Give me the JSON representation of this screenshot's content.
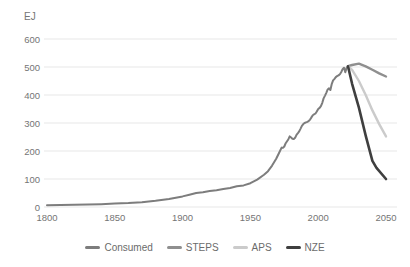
{
  "chart_data": {
    "type": "line",
    "title": "",
    "unit_label": "EJ",
    "xlabel": "",
    "ylabel": "EJ",
    "xlim": [
      1800,
      2050
    ],
    "ylim": [
      0,
      600
    ],
    "x_ticks": [
      1800,
      1850,
      1900,
      1950,
      2000,
      2050
    ],
    "y_ticks": [
      600,
      500,
      400,
      300,
      200,
      100,
      0
    ],
    "grid": "horizontal",
    "legend_position": "bottom",
    "series": [
      {
        "name": "Consumed",
        "color": "#7d7d7d",
        "width": 2,
        "points": [
          [
            1800,
            6
          ],
          [
            1810,
            7
          ],
          [
            1820,
            8
          ],
          [
            1830,
            9
          ],
          [
            1840,
            10
          ],
          [
            1850,
            12
          ],
          [
            1860,
            14
          ],
          [
            1870,
            17
          ],
          [
            1880,
            22
          ],
          [
            1890,
            29
          ],
          [
            1900,
            38
          ],
          [
            1905,
            44
          ],
          [
            1910,
            50
          ],
          [
            1915,
            53
          ],
          [
            1920,
            57
          ],
          [
            1925,
            60
          ],
          [
            1930,
            64
          ],
          [
            1935,
            68
          ],
          [
            1940,
            74
          ],
          [
            1945,
            77
          ],
          [
            1950,
            85
          ],
          [
            1955,
            98
          ],
          [
            1960,
            115
          ],
          [
            1963,
            128
          ],
          [
            1966,
            148
          ],
          [
            1969,
            172
          ],
          [
            1971,
            192
          ],
          [
            1973,
            212
          ],
          [
            1974,
            211
          ],
          [
            1975,
            216
          ],
          [
            1976,
            228
          ],
          [
            1978,
            242
          ],
          [
            1979,
            252
          ],
          [
            1980,
            248
          ],
          [
            1981,
            244
          ],
          [
            1982,
            243
          ],
          [
            1983,
            247
          ],
          [
            1984,
            258
          ],
          [
            1985,
            264
          ],
          [
            1986,
            270
          ],
          [
            1987,
            280
          ],
          [
            1988,
            290
          ],
          [
            1989,
            296
          ],
          [
            1990,
            300
          ],
          [
            1991,
            302
          ],
          [
            1992,
            304
          ],
          [
            1993,
            307
          ],
          [
            1994,
            312
          ],
          [
            1995,
            320
          ],
          [
            1996,
            328
          ],
          [
            1997,
            331
          ],
          [
            1998,
            334
          ],
          [
            1999,
            341
          ],
          [
            2000,
            350
          ],
          [
            2001,
            354
          ],
          [
            2002,
            360
          ],
          [
            2003,
            372
          ],
          [
            2004,
            388
          ],
          [
            2005,
            398
          ],
          [
            2006,
            408
          ],
          [
            2007,
            420
          ],
          [
            2008,
            424
          ],
          [
            2009,
            418
          ],
          [
            2010,
            440
          ],
          [
            2011,
            452
          ],
          [
            2012,
            458
          ],
          [
            2013,
            464
          ],
          [
            2014,
            468
          ],
          [
            2015,
            470
          ],
          [
            2016,
            474
          ],
          [
            2017,
            482
          ],
          [
            2018,
            492
          ],
          [
            2019,
            497
          ],
          [
            2020,
            481
          ],
          [
            2021,
            498
          ],
          [
            2022,
            503
          ]
        ]
      },
      {
        "name": "STEPS",
        "color": "#8f8f8f",
        "width": 2.4,
        "points": [
          [
            2022,
            503
          ],
          [
            2025,
            507
          ],
          [
            2030,
            512
          ],
          [
            2035,
            502
          ],
          [
            2040,
            490
          ],
          [
            2045,
            477
          ],
          [
            2050,
            466
          ]
        ]
      },
      {
        "name": "APS",
        "color": "#cbcbcb",
        "width": 2.4,
        "points": [
          [
            2022,
            503
          ],
          [
            2025,
            490
          ],
          [
            2030,
            450
          ],
          [
            2035,
            400
          ],
          [
            2040,
            345
          ],
          [
            2045,
            296
          ],
          [
            2050,
            252
          ]
        ]
      },
      {
        "name": "NZE",
        "color": "#3f3f3f",
        "width": 2.6,
        "points": [
          [
            2022,
            503
          ],
          [
            2025,
            440
          ],
          [
            2030,
            355
          ],
          [
            2035,
            255
          ],
          [
            2040,
            165
          ],
          [
            2043,
            140
          ],
          [
            2050,
            100
          ]
        ]
      }
    ],
    "legend": [
      "Consumed",
      "STEPS",
      "APS",
      "NZE"
    ]
  },
  "colors": {
    "background": "#ffffff",
    "gridline": "#e7e7e7",
    "tick_text": "#757575",
    "legend_text": "#6b6b6b"
  }
}
